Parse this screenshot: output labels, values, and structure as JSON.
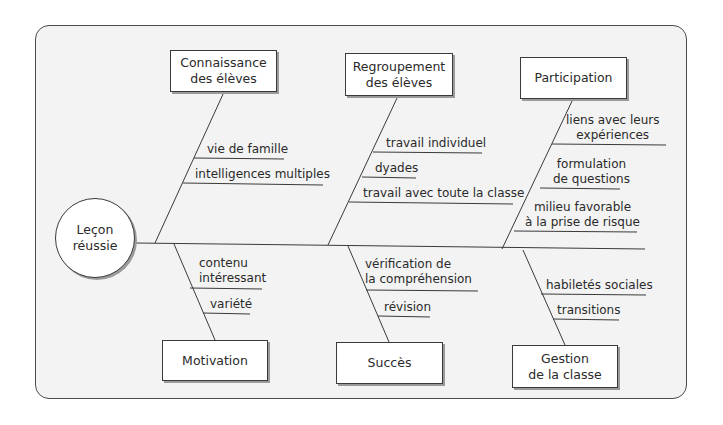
{
  "diagram": {
    "type": "fishbone",
    "effect": "Leçon\nréussie",
    "categories": {
      "top": [
        {
          "label": "Connaissance\ndes élèves",
          "causes": [
            "vie de famille",
            "intelligences multiples"
          ]
        },
        {
          "label": "Regroupement\ndes élèves",
          "causes": [
            "travail individuel",
            "dyades",
            "travail avec toute la classe"
          ]
        },
        {
          "label": "Participation",
          "causes": [
            "liens avec leurs\nexpériences",
            "formulation\nde questions",
            "milieu favorable\nà la prise de risque"
          ]
        }
      ],
      "bottom": [
        {
          "label": "Motivation",
          "causes": [
            "contenu\nintéressant",
            "variété"
          ]
        },
        {
          "label": "Succès",
          "causes": [
            "vérification de\nla compréhension",
            "révision"
          ]
        },
        {
          "label": "Gestion\nde la classe",
          "causes": [
            "habiletés sociales",
            "transitions"
          ]
        }
      ]
    },
    "colors": {
      "line": "#3a3a3a",
      "frame_fill": "#f3f3f3",
      "box_fill": "#ffffff",
      "shadow": "#9a9a9a"
    }
  }
}
